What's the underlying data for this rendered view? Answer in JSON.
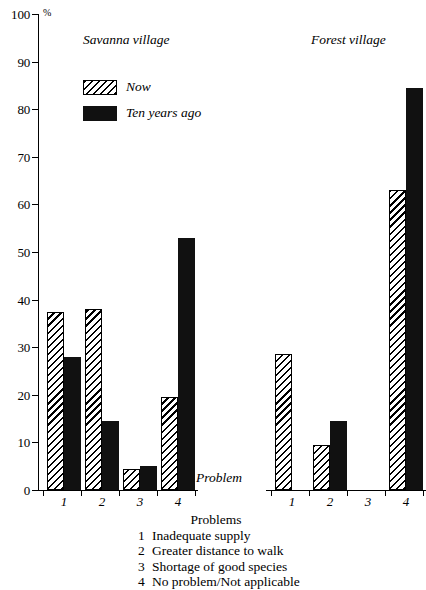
{
  "chart_data": {
    "type": "bar",
    "title": "",
    "ylabel": "%",
    "xlabel": "Problem",
    "ylim": [
      0,
      100
    ],
    "yticks": [
      0,
      10,
      20,
      30,
      40,
      50,
      60,
      70,
      80,
      90,
      100
    ],
    "grid": false,
    "legend_position": "upper-left-inside",
    "categories": [
      "1",
      "2",
      "3",
      "4"
    ],
    "panels": [
      {
        "name": "Savanna village",
        "series": [
          {
            "name": "Now",
            "values": [
              37.5,
              38,
              4.5,
              19.5
            ]
          },
          {
            "name": "Ten years ago",
            "values": [
              28,
              14.5,
              5,
              53
            ]
          }
        ]
      },
      {
        "name": "Forest village",
        "series": [
          {
            "name": "Now",
            "values": [
              28.5,
              9.5,
              0,
              63
            ]
          },
          {
            "name": "Ten years ago",
            "values": [
              0,
              14.5,
              0,
              84.5
            ]
          }
        ]
      }
    ],
    "legend": [
      {
        "label": "Now",
        "pattern": "diagonal-hatch"
      },
      {
        "label": "Ten years ago",
        "pattern": "solid-black"
      }
    ],
    "annotations": {
      "axis_note": "Problem"
    }
  },
  "axis": {
    "unit_symbol": "%",
    "tick_labels": [
      "100",
      "90",
      "80",
      "70",
      "60",
      "50",
      "40",
      "30",
      "20",
      "10",
      "0"
    ],
    "category_labels": [
      "1",
      "2",
      "3",
      "4"
    ]
  },
  "panels": {
    "savanna": {
      "title": "Savanna village"
    },
    "forest": {
      "title": "Forest village"
    }
  },
  "legend": {
    "now_label": "Now",
    "then_label": "Ten years ago"
  },
  "footer": {
    "heading": "Problems",
    "items": [
      {
        "num": "1",
        "text": "Inadequate supply"
      },
      {
        "num": "2",
        "text": "Greater distance to walk"
      },
      {
        "num": "3",
        "text": "Shortage of good species"
      },
      {
        "num": "4",
        "text": "No problem/Not applicable"
      }
    ]
  },
  "colors": {
    "ink": "#000000",
    "bar_then": "#111111",
    "background": "#ffffff"
  }
}
